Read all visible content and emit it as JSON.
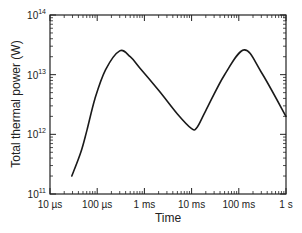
{
  "chart_data": {
    "type": "line",
    "title": "",
    "xlabel": "Time",
    "ylabel": "Total thermal power (W)",
    "xscale": "log",
    "yscale": "log",
    "xlim_seconds": [
      1e-05,
      1
    ],
    "ylim": [
      100000000000.0,
      100000000000000.0
    ],
    "x_ticks": [
      {
        "value": 1e-05,
        "label": "10 µs"
      },
      {
        "value": 0.0001,
        "label": "100 µs"
      },
      {
        "value": 0.001,
        "label": "1 ms"
      },
      {
        "value": 0.01,
        "label": "10 ms"
      },
      {
        "value": 0.1,
        "label": "100 ms"
      },
      {
        "value": 1,
        "label": "1 s"
      }
    ],
    "y_ticks": [
      {
        "value": 100000000000.0,
        "base": "10",
        "exp": "11"
      },
      {
        "value": 1000000000000.0,
        "base": "10",
        "exp": "12"
      },
      {
        "value": 10000000000000.0,
        "base": "10",
        "exp": "13"
      },
      {
        "value": 100000000000000.0,
        "base": "10",
        "exp": "14"
      }
    ],
    "grid": false,
    "legend": null,
    "series": [
      {
        "name": "Total thermal power",
        "x_seconds": [
          2.9e-05,
          4.5e-05,
          6.1e-05,
          9e-05,
          0.00015,
          0.0003,
          0.0005,
          0.0008,
          0.002,
          0.005,
          0.01,
          0.013,
          0.02,
          0.05,
          0.13,
          0.3,
          1
        ],
        "y_watts": [
          200000000000.0,
          500000000000.0,
          1200000000000.0,
          4000000000000.0,
          12000000000000.0,
          25000000000000.0,
          20000000000000.0,
          13000000000000.0,
          5500000000000.0,
          2200000000000.0,
          1250000000000.0,
          1300000000000.0,
          2500000000000.0,
          10000000000000.0,
          26000000000000.0,
          11000000000000.0,
          2000000000000.0
        ]
      }
    ]
  }
}
